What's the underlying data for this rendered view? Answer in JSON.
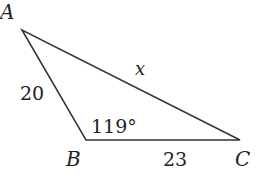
{
  "diagram": {
    "type": "triangle",
    "vertices": [
      {
        "name": "A",
        "x": 22,
        "y": 30
      },
      {
        "name": "B",
        "x": 86,
        "y": 140
      },
      {
        "name": "C",
        "x": 240,
        "y": 140
      }
    ],
    "labels": {
      "vertex_a": "A",
      "vertex_b": "B",
      "vertex_c": "C",
      "side_ab": "20",
      "side_bc": "23",
      "side_ac": "x",
      "angle_b": "119°"
    },
    "stroke_color": "#333333"
  }
}
